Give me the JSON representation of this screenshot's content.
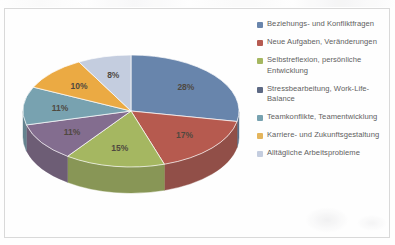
{
  "chart_data": {
    "type": "pie",
    "title": "",
    "subtitle": "",
    "xlabel": "",
    "ylabel": "",
    "grid": false,
    "legend_position": "right",
    "three_d": true,
    "categories": [
      "Beziehungs- und Konfliktfragen",
      "Neue Aufgaben, Veränderungen",
      "Selbstreflexion, persönliche Entwicklung",
      "Stressbearbeitung, Work-Life-Balance",
      "Teamkonflikte, Teamentwicklung",
      "Karriere- und Zukunftsgestaltung",
      "Alltägliche Arbeitsprobleme"
    ],
    "values": [
      28,
      17,
      15,
      11,
      11,
      10,
      8
    ],
    "data_labels": [
      "28%",
      "17%",
      "15%",
      "11%",
      "11%",
      "10%",
      "8%"
    ],
    "unit": "%",
    "colors": [
      "#4a6c9b",
      "#a8392c",
      "#93a93f",
      "#6b4f78",
      "#5b8fa0",
      "#e8991f",
      "#b9c4da"
    ],
    "side_colors": [
      "#35506f",
      "#7a2a20",
      "#6f8130",
      "#4f3a59",
      "#446b78",
      "#b87416",
      "#8e97a9"
    ]
  },
  "legend": {
    "items": [
      {
        "label": "Beziehungs- und Konfliktfragen",
        "color": "#4a6c9b"
      },
      {
        "label": "Neue Aufgaben, Veränderungen",
        "color": "#a8392c"
      },
      {
        "label": "Selbstreflexion, persönliche Entwicklung",
        "color": "#93a93f"
      },
      {
        "label": "Stressbearbeitung, Work-Life-Balance",
        "color": "#3b4a6b"
      },
      {
        "label": "Teamkonflikte, Teamentwicklung",
        "color": "#5b8fa0"
      },
      {
        "label": "Karriere- und Zukunftsgestaltung",
        "color": "#e0a63a"
      },
      {
        "label": "Alltägliche Arbeitsprobleme",
        "color": "#b9c4da"
      }
    ]
  },
  "frame": {
    "border_color": "#d2d2d2",
    "background": "#ffffff"
  }
}
